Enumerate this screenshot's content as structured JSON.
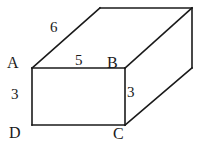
{
  "figure": {
    "background_color": "#ffffff",
    "line_color": "#1a1a1a",
    "text_color": "#1a1a1a",
    "width": 203,
    "height": 151,
    "vertices": {
      "A": "A",
      "B": "B",
      "C": "C",
      "D": "D"
    },
    "measurements": {
      "top_edge": "6",
      "front_top_edge": "5",
      "left_edge": "3",
      "right_edge": "3"
    },
    "geometry": {
      "front_face": [
        [
          32,
          68
        ],
        [
          125,
          68
        ],
        [
          125,
          125
        ],
        [
          32,
          125
        ]
      ],
      "top_back_left": [
        100,
        8
      ],
      "top_back_right": [
        192,
        8
      ],
      "right_back_bottom": [
        192,
        68
      ],
      "edge_A_to_top_back_left": [
        [
          32,
          68
        ],
        [
          100,
          8
        ]
      ],
      "edge_top_back": [
        [
          100,
          8
        ],
        [
          192,
          8
        ]
      ],
      "edge_B_to_top_back_right": [
        [
          125,
          68
        ],
        [
          192,
          8
        ]
      ],
      "edge_right_vertical": [
        [
          192,
          8
        ],
        [
          192,
          68
        ]
      ],
      "edge_C_to_right_back_bottom": [
        [
          125,
          125
        ],
        [
          192,
          68
        ]
      ]
    }
  }
}
